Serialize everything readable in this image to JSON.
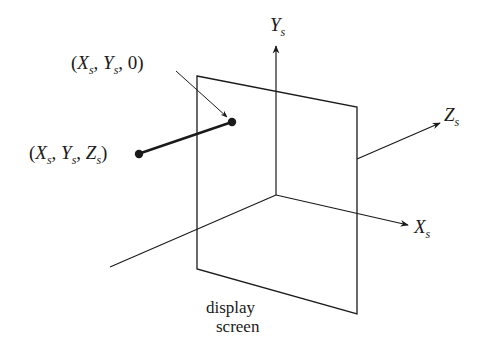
{
  "diagram": {
    "type": "3d-coordinate-projection",
    "labels": {
      "point_projected": {
        "open": "(",
        "x": "X",
        "x_sub": "s",
        "sep1": ", ",
        "y": "Y",
        "y_sub": "s",
        "sep2": ", ",
        "z": "0",
        "close": ")"
      },
      "point_world": {
        "open": "(",
        "x": "X",
        "x_sub": "s",
        "sep1": ", ",
        "y": "Y",
        "y_sub": "s",
        "sep2": ", ",
        "z": "Z",
        "z_sub": "s",
        "close": ")"
      },
      "axis_y": {
        "name": "Y",
        "sub": "s"
      },
      "axis_x": {
        "name": "X",
        "sub": "s"
      },
      "axis_z": {
        "name": "Z",
        "sub": "s"
      },
      "screen_line1": "display",
      "screen_line2": "screen"
    },
    "colors": {
      "ink": "#1a1a1a",
      "background": "#ffffff"
    },
    "geometry": {
      "screen_quad": [
        [
          197,
          76
        ],
        [
          357,
          107
        ],
        [
          357,
          314
        ],
        [
          197,
          269
        ]
      ],
      "origin": [
        276,
        195
      ],
      "y_axis_end": [
        276,
        45
      ],
      "x_axis_end": [
        408,
        225
      ],
      "z_axis_start": [
        357,
        159
      ],
      "z_axis_end": [
        440,
        123
      ],
      "back_axis_end": [
        110,
        267
      ],
      "projected_point": [
        232,
        122
      ],
      "world_point": [
        138,
        154
      ],
      "pointer_arrow": [
        [
          176,
          71
        ],
        [
          228,
          118
        ]
      ]
    }
  }
}
